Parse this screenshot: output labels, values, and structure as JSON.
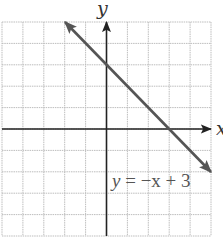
{
  "chart_data": {
    "type": "line",
    "title": "",
    "xlabel": "x",
    "ylabel": "y",
    "xlim": [
      -5,
      5
    ],
    "ylim": [
      -5,
      5
    ],
    "grid": true,
    "tick_labels_shown": false,
    "series": [
      {
        "name": "y = -x + 3",
        "equation": "y = -x + 3",
        "slope": -1,
        "intercept": 3,
        "x": [
          -2,
          0,
          3,
          5
        ],
        "y": [
          5,
          3,
          0,
          -2
        ],
        "arrows_both_ends": true
      }
    ],
    "annotations": [
      {
        "text": "y = −x + 3",
        "x": 0.3,
        "y": -2.7
      }
    ]
  },
  "labels": {
    "x_axis": "x",
    "y_axis": "y",
    "equation_y": "y",
    "equation_rest": " = −x + 3"
  },
  "colors": {
    "grid": "#bdbdbd",
    "axis": "#222222",
    "line": "#555555",
    "background": "#ffffff"
  }
}
